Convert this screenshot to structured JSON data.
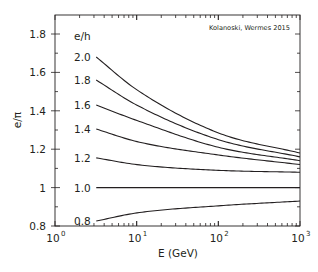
{
  "chart_data": {
    "type": "line",
    "title": "",
    "annotation": "Kolanoski, Wermes 2015",
    "xlabel": "E (GeV)",
    "ylabel": "e/π",
    "xscale": "log",
    "xlim": [
      1,
      1000
    ],
    "ylim": [
      0.8,
      1.9
    ],
    "x_ticks": [
      {
        "value": 1,
        "base": "10",
        "exp": "0"
      },
      {
        "value": 10,
        "base": "10",
        "exp": "1"
      },
      {
        "value": 100,
        "base": "10",
        "exp": "2"
      },
      {
        "value": 1000,
        "base": "10",
        "exp": "3"
      }
    ],
    "y_ticks": [
      {
        "value": 0.8,
        "label": "0.8"
      },
      {
        "value": 1.0,
        "label": "1"
      },
      {
        "value": 1.2,
        "label": "1.2"
      },
      {
        "value": 1.4,
        "label": "1.4"
      },
      {
        "value": 1.6,
        "label": "1.6"
      },
      {
        "value": 1.8,
        "label": "1.8"
      }
    ],
    "grid": false,
    "legend_title": "e/h",
    "x": [
      3.2,
      10,
      100,
      1000
    ],
    "series": [
      {
        "name": "2.0",
        "values": [
          1.68,
          1.51,
          1.285,
          1.18
        ]
      },
      {
        "name": "1.8",
        "values": [
          1.56,
          1.43,
          1.25,
          1.16
        ]
      },
      {
        "name": "1.6",
        "values": [
          1.43,
          1.35,
          1.21,
          1.14
        ]
      },
      {
        "name": "1.4",
        "values": [
          1.305,
          1.24,
          1.17,
          1.12
        ]
      },
      {
        "name": "1.2",
        "values": [
          1.155,
          1.12,
          1.09,
          1.08
        ]
      },
      {
        "name": "1.0",
        "values": [
          1.0,
          1.0,
          1.0,
          1.0
        ]
      },
      {
        "name": "0.8",
        "values": [
          0.826,
          0.868,
          0.905,
          0.93
        ]
      }
    ],
    "line_color": "#231f20"
  }
}
